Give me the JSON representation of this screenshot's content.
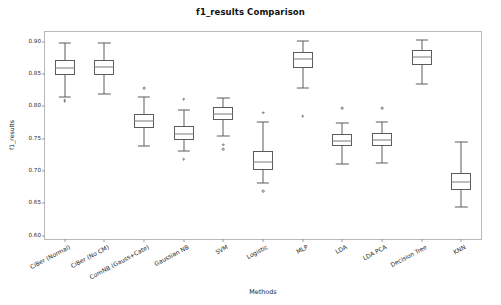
{
  "chart_data": {
    "type": "box",
    "title": "f1_results Comparison",
    "xlabel": "Methods",
    "ylabel": "f1_results",
    "ylim": [
      0.595,
      0.915
    ],
    "grid": false,
    "legend": "none",
    "yticks": [
      0.6,
      0.65,
      0.7,
      0.75,
      0.8,
      0.85,
      0.9
    ],
    "ytick_labels": [
      "0.60",
      "0.65",
      "0.70",
      "0.75",
      "0.80",
      "0.85",
      "0.90"
    ],
    "categories": [
      "CiBer (Normal)",
      "CiBer (No CM)",
      "ComNB (Gauss+Cate)",
      "Gaussian NB",
      "SVM",
      "Logistic",
      "MLP",
      "LDA",
      "LDA PCA",
      "Decision Tree",
      "KNN"
    ],
    "boxes": [
      {
        "label": "CiBer (Normal)",
        "whisker_low": 0.8145,
        "q1": 0.849,
        "median": 0.86,
        "q3": 0.8715,
        "whisker_high": 0.8985,
        "fliers": [
          0.8095,
          0.8075
        ]
      },
      {
        "label": "CiBer (No CM)",
        "whisker_low": 0.819,
        "q1": 0.849,
        "median": 0.861,
        "q3": 0.872,
        "whisker_high": 0.8985,
        "fliers": []
      },
      {
        "label": "ComNB (Gauss+Cate)",
        "whisker_low": 0.7395,
        "q1": 0.7665,
        "median": 0.778,
        "q3": 0.789,
        "whisker_high": 0.814,
        "fliers": [
          0.8285
        ]
      },
      {
        "label": "Gaussian NB",
        "whisker_low": 0.731,
        "q1": 0.748,
        "median": 0.758,
        "q3": 0.77,
        "whisker_high": 0.794,
        "fliers": [
          0.8115,
          0.7185
        ]
      },
      {
        "label": "SVM",
        "whisker_low": 0.7545,
        "q1": 0.779,
        "median": 0.789,
        "q3": 0.799,
        "whisker_high": 0.8135,
        "fliers": [
          0.7405,
          0.734
        ]
      },
      {
        "label": "Logistic",
        "whisker_low": 0.681,
        "q1": 0.702,
        "median": 0.7135,
        "q3": 0.7305,
        "whisker_high": 0.776,
        "fliers": [
          0.79,
          0.669
        ]
      },
      {
        "label": "MLP",
        "whisker_low": 0.829,
        "q1": 0.859,
        "median": 0.873,
        "q3": 0.884,
        "whisker_high": 0.901,
        "fliers": [
          0.7845
        ]
      },
      {
        "label": "LDA",
        "whisker_low": 0.711,
        "q1": 0.738,
        "median": 0.747,
        "q3": 0.757,
        "whisker_high": 0.774,
        "fliers": [
          0.797
        ]
      },
      {
        "label": "LDA PCA",
        "whisker_low": 0.713,
        "q1": 0.739,
        "median": 0.748,
        "q3": 0.759,
        "whisker_high": 0.7755,
        "fliers": [
          0.7975
        ]
      },
      {
        "label": "Decision Tree",
        "whisker_low": 0.834,
        "q1": 0.864,
        "median": 0.876,
        "q3": 0.8865,
        "whisker_high": 0.9025,
        "fliers": []
      },
      {
        "label": "KNN",
        "whisker_low": 0.645,
        "q1": 0.67,
        "median": 0.683,
        "q3": 0.6975,
        "whisker_high": 0.745,
        "fliers": []
      }
    ]
  }
}
